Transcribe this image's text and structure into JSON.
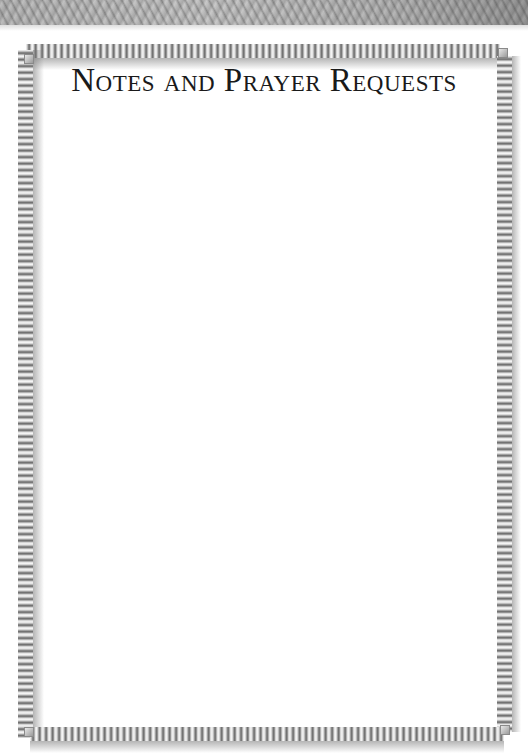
{
  "page": {
    "title": "Notes and Prayer Requests",
    "background_texture": "leather-gray",
    "frame_style": "coiled-spring-border",
    "colors": {
      "paper": "#ffffff",
      "title_text": "#1a1a1a",
      "leather_band": "#bdbdbd",
      "spring_dark": "#6a6a6a",
      "spring_light": "#f4f4f4"
    }
  },
  "notes": {
    "content": ""
  }
}
